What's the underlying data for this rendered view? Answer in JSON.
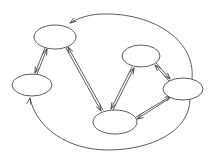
{
  "figure": {
    "kind": "directed-graph",
    "title": "",
    "width": 216,
    "height": 158,
    "background_color": "#ffffff",
    "stroke_color": "#4a4a4a",
    "node_fill_color": "#ffffff",
    "stroke_width": 0.9,
    "arrow_color": "#3f3f3f"
  },
  "nodes": [
    {
      "id": "n1",
      "label": "",
      "name": "node-top-left",
      "cx": 55,
      "cy": 37,
      "rx": 21,
      "ry": 12
    },
    {
      "id": "n2",
      "label": "",
      "name": "node-left",
      "cx": 32,
      "cy": 85,
      "rx": 20,
      "ry": 11
    },
    {
      "id": "n3",
      "label": "",
      "name": "node-bottom-center",
      "cx": 115,
      "cy": 122,
      "rx": 22,
      "ry": 12
    },
    {
      "id": "n4",
      "label": "",
      "name": "node-upper-right",
      "cx": 141,
      "cy": 56,
      "rx": 19,
      "ry": 11
    },
    {
      "id": "n5",
      "label": "",
      "name": "node-right",
      "cx": 183,
      "cy": 89,
      "rx": 20,
      "ry": 11
    }
  ],
  "edges": [
    {
      "id": "e1",
      "name": "edge-n1-to-n2",
      "from": "n1",
      "to": "n2",
      "directed": true,
      "path": "M 45 48 L 35 73",
      "arrow_at": "end",
      "arrow_angle": 112
    },
    {
      "id": "e2",
      "name": "edge-n2-to-n1",
      "from": "n2",
      "to": "n1",
      "directed": true,
      "path": "M 37 74 L 47 49",
      "arrow_at": "end",
      "arrow_angle": -68
    },
    {
      "id": "e3",
      "name": "edge-n1-to-n3",
      "from": "n1",
      "to": "n3",
      "directed": true,
      "path": "M 66 48 L 101 111",
      "arrow_at": "end",
      "arrow_angle": 61
    },
    {
      "id": "e4",
      "name": "edge-n3-to-n1",
      "from": "n3",
      "to": "n1",
      "directed": true,
      "path": "M 103 110 L 68 47",
      "arrow_at": "end",
      "arrow_angle": -119
    },
    {
      "id": "e5",
      "name": "edge-n5-to-n1-outer-top",
      "from": "n5",
      "to": "n1",
      "directed": true,
      "path": "M 192 79 C 196 38, 150 13, 104 14 C 90 14, 78 18, 70 23",
      "arrow_at": "end",
      "arrow_angle": 146
    },
    {
      "id": "e6",
      "name": "edge-n5-to-n2-outer-bottom",
      "from": "n5",
      "to": "n2",
      "directed": true,
      "path": "M 190 99 C 190 132, 150 150, 108 150 C 68 150, 36 128, 30 98",
      "arrow_at": "end",
      "arrow_angle": -79
    },
    {
      "id": "e7",
      "name": "edge-n3-to-n4",
      "from": "n3",
      "to": "n4",
      "directed": true,
      "path": "M 113 110 L 134 68",
      "arrow_at": "end",
      "arrow_angle": -63
    },
    {
      "id": "e8",
      "name": "edge-n4-to-n3",
      "from": "n4",
      "to": "n3",
      "directed": true,
      "path": "M 132 67 L 111 109",
      "arrow_at": "end",
      "arrow_angle": 117
    },
    {
      "id": "e9",
      "name": "edge-n4-to-n5",
      "from": "n4",
      "to": "n5",
      "directed": true,
      "path": "M 156 63 L 170 79",
      "arrow_at": "end",
      "arrow_angle": 49
    },
    {
      "id": "e10",
      "name": "edge-n5-to-n4",
      "from": "n5",
      "to": "n4",
      "directed": true,
      "path": "M 169 81 L 155 65",
      "arrow_at": "end",
      "arrow_angle": -131
    },
    {
      "id": "e11",
      "name": "edge-n3-to-n5",
      "from": "n3",
      "to": "n5",
      "directed": true,
      "path": "M 136 117 L 171 96",
      "arrow_at": "end",
      "arrow_angle": -31
    },
    {
      "id": "e12",
      "name": "edge-n5-to-n3",
      "from": "n5",
      "to": "n3",
      "directed": true,
      "path": "M 170 98 L 137 119",
      "arrow_at": "end",
      "arrow_angle": 149
    }
  ]
}
